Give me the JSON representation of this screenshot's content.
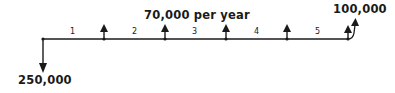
{
  "diagram": {
    "type": "cash-flow-diagram",
    "initial_outflow": {
      "label": "250,000",
      "direction": "down",
      "year": 0
    },
    "annual_inflow": {
      "label": "70,000 per year",
      "direction": "up",
      "years": [
        1,
        2,
        3,
        4,
        5
      ]
    },
    "salvage_inflow": {
      "label": "100,000",
      "direction": "up",
      "year": 5
    },
    "periods": [
      "1",
      "2",
      "3",
      "4",
      "5"
    ],
    "colors": {
      "ink": "#1a1a1a",
      "background": "#ffffff"
    }
  }
}
